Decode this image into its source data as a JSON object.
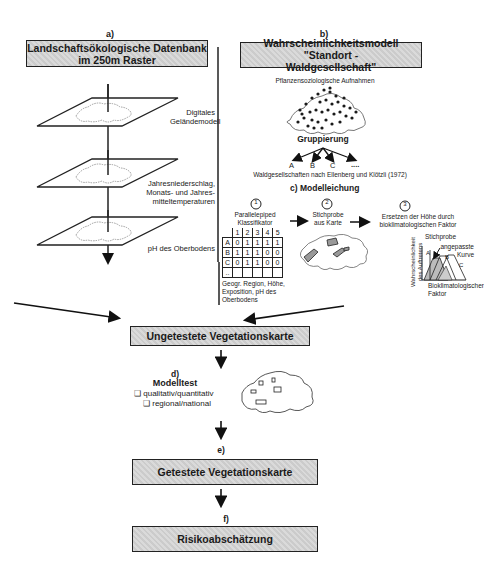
{
  "section_a": {
    "letter": "a)",
    "title_line1": "Landschaftsökologische Datenbank",
    "title_line2": "im 250m Raster",
    "layers": [
      {
        "label_line1": "Digitales",
        "label_line2": "Geländemodell"
      },
      {
        "label_line1": "Jahresniederschlag,",
        "label_line2": "Monats- und Jahres-",
        "label_line3": "mitteltemperaturen"
      },
      {
        "label_line1": "pH des Oberbodens"
      }
    ]
  },
  "section_b": {
    "letter": "b)",
    "title_line1": "Wahrscheinlichkeitsmodell \"Standort -",
    "title_line2": "Waldgesellschaft\"",
    "survey_label": "Pflanzensoziologische Aufnahmen",
    "grouping_label": "Gruppierung",
    "groups": [
      "A",
      "B",
      "C",
      "...."
    ],
    "groups_caption": "Waldgesellschaften nach Ellenberg und Klötzli (1972)"
  },
  "section_c": {
    "title": "c) Modelleichung",
    "steps": [
      {
        "number": "1",
        "label_line1": "Parallelepiped",
        "label_line2": "Klassifikator"
      },
      {
        "number": "2",
        "label_line1": "Stichprobe",
        "label_line2": "aus Karte"
      },
      {
        "number": "3",
        "label_line1": "Ersetzen der Höhe durch",
        "label_line2": "bioklimatologischen Faktor"
      }
    ],
    "classifier_table": {
      "columns": [
        "1",
        "2",
        "3",
        "4",
        "5"
      ],
      "rows": [
        {
          "label": "A",
          "values": [
            "0",
            "1",
            "1",
            "1",
            "1"
          ]
        },
        {
          "label": "B",
          "values": [
            "1",
            "1",
            "1",
            "0",
            "0"
          ]
        },
        {
          "label": "C",
          "values": [
            "0",
            "1",
            "1",
            "0",
            "0"
          ]
        },
        {
          "label": "..",
          "values": [
            "",
            "",
            "",
            "",
            ""
          ]
        }
      ],
      "caption_line1": "Geogr. Region, Höhe,",
      "caption_line2": "Exposition, pH des",
      "caption_line3": "Oberbodens"
    },
    "curve_chart": {
      "sample_label": "Stichprobe",
      "fitted_label_line1": "angepasste",
      "fitted_label_line2": "Kurve",
      "ylabel_line1": "Wahrscheinlichkeit",
      "ylabel_line2": "des Auftretens",
      "xlabel_line1": "Bioklimatologischer",
      "xlabel_line2": "Faktor",
      "curves": [
        "A",
        "B",
        "C"
      ]
    }
  },
  "untested_map": {
    "title": "Ungetestete Vegetationskarte"
  },
  "section_d": {
    "letter": "d)",
    "title": "Modelltest",
    "options": [
      "qualitativ/quantitativ",
      "regional/national"
    ]
  },
  "section_e": {
    "letter": "e)",
    "title": "Getestete Vegetationskarte"
  },
  "section_f": {
    "letter": "f)",
    "title": "Risikoabschätzung"
  }
}
